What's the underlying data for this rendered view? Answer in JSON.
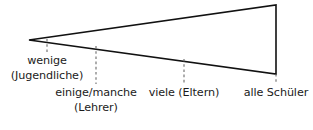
{
  "figure": {
    "type": "wedge-scale-diagram",
    "background_color": "#ffffff",
    "stroke_color": "#111111",
    "text_color": "#1b1b1b",
    "dash_color": "#6b6b6b"
  },
  "wedge": {
    "apex": {
      "x": 29,
      "y": 40
    },
    "top_right": {
      "x": 276,
      "y": 5
    },
    "bottom_right": {
      "x": 276,
      "y": 74
    },
    "stroke_width": 1.6
  },
  "ticks": [
    {
      "x": 47,
      "top": 39,
      "bottom": 52
    },
    {
      "x": 96,
      "top": 46,
      "bottom": 84
    },
    {
      "x": 184,
      "top": 59,
      "bottom": 84
    },
    {
      "x": 276,
      "top": 74,
      "bottom": 84
    }
  ],
  "labels": {
    "wenige": {
      "line1": "wenige",
      "line2": "(Jugendliche)"
    },
    "einige": {
      "line1": "einige/manche",
      "line2": "(Lehrer)"
    },
    "viele": {
      "line1": "viele (Eltern)",
      "line2": ""
    },
    "alle": {
      "line1": "alle Schüler",
      "line2": ""
    }
  }
}
